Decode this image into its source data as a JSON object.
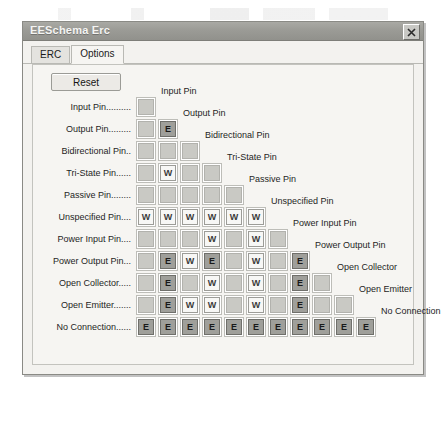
{
  "window": {
    "title": "EESchema Erc",
    "close_icon": "close-icon"
  },
  "tabs": [
    {
      "label": "ERC",
      "active": false
    },
    {
      "label": "Options",
      "active": true
    }
  ],
  "toolbar": {
    "reset_label": "Reset"
  },
  "matrix": {
    "row_labels": [
      "Input Pin..........",
      "Output Pin.........",
      "Bidirectional Pin..",
      "Tri-State Pin......",
      "Passive Pin........",
      "Unspecified Pin....",
      "Power Input Pin....",
      "Power Output Pin...",
      "Open Collector.....",
      "Open Emitter.......",
      "No Connection......"
    ],
    "col_labels": [
      "Input Pin",
      "Output Pin",
      "Bidirectional Pin",
      "Tri-State Pin",
      "Passive Pin",
      "Unspecified Pin",
      "Power Input Pin",
      "Power Output Pin",
      "Open Collector",
      "Open Emitter",
      "No Connection"
    ],
    "legend": {
      "ok": "",
      "warning": "W",
      "error": "E"
    },
    "cells": [
      [
        "ok"
      ],
      [
        "ok",
        "err"
      ],
      [
        "ok",
        "ok",
        "ok"
      ],
      [
        "ok",
        "warn",
        "ok",
        "ok"
      ],
      [
        "ok",
        "ok",
        "ok",
        "ok",
        "ok"
      ],
      [
        "warn",
        "warn",
        "warn",
        "warn",
        "warn",
        "warn"
      ],
      [
        "ok",
        "ok",
        "ok",
        "warn",
        "ok",
        "warn",
        "ok"
      ],
      [
        "ok",
        "err",
        "warn",
        "err",
        "ok",
        "warn",
        "ok",
        "err"
      ],
      [
        "ok",
        "err",
        "ok",
        "warn",
        "ok",
        "warn",
        "ok",
        "err",
        "ok"
      ],
      [
        "ok",
        "err",
        "warn",
        "warn",
        "ok",
        "warn",
        "ok",
        "err",
        "ok",
        "ok"
      ],
      [
        "err",
        "err",
        "err",
        "err",
        "err",
        "err",
        "err",
        "err",
        "err",
        "err",
        "err"
      ]
    ]
  },
  "colors": {
    "titlebar": "#9b9b96",
    "panel_bg": "#f6f5f2",
    "cell_ok": "#c9c9c4",
    "cell_warning": "#f7f7f5",
    "cell_error": "#9f9f9a"
  }
}
